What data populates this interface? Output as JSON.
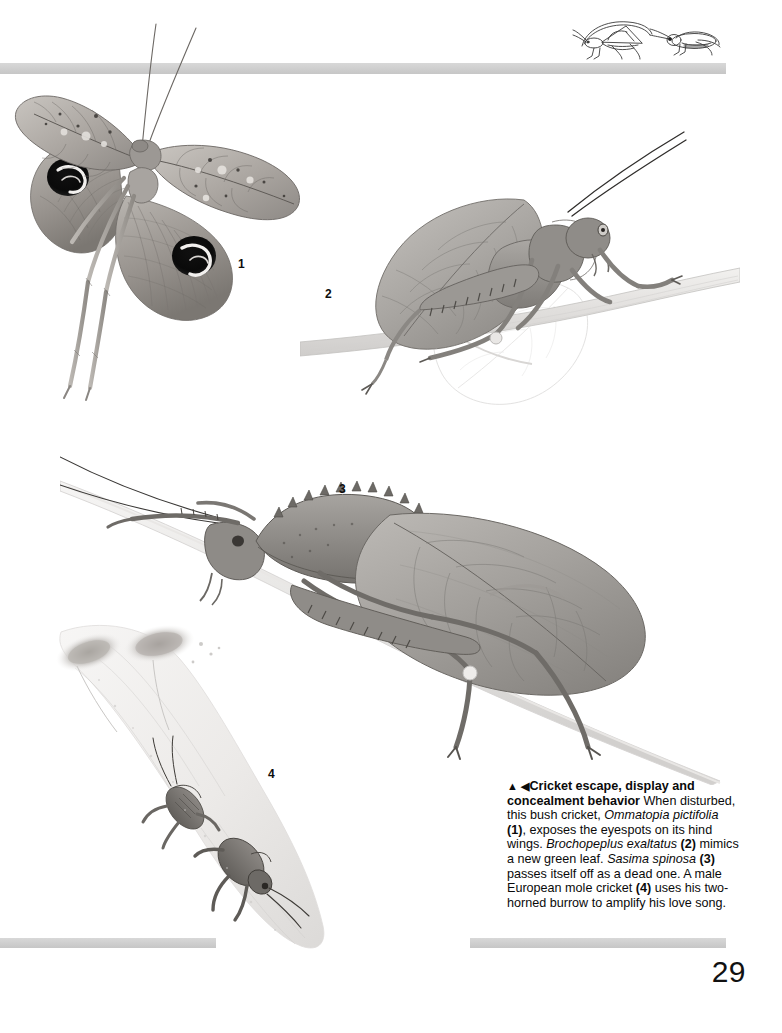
{
  "page": {
    "number": "29",
    "background_color": "#ffffff",
    "rule_color": "#cfcfcf",
    "text_color": "#0a0a0a"
  },
  "header": {
    "icons": [
      {
        "name": "bush-cricket-line-icon",
        "label": "bush cricket line drawing"
      },
      {
        "name": "grasshopper-line-icon",
        "label": "grasshopper line drawing"
      }
    ]
  },
  "figures": [
    {
      "number": "1",
      "name": "ommatopia-pictifolia-eyespot-display",
      "species": "Ommatopia pictifolia",
      "description": "Bush cricket with leaf-like forewings spread, exposing two dark eyespots on the hind wings"
    },
    {
      "number": "2",
      "name": "brochopeplus-exaltatus-green-leaf-mimic",
      "species": "Brochopeplus exaltatus",
      "description": "Katydid mimicking a new green leaf, perched on a twig with a pale leaf behind"
    },
    {
      "number": "3",
      "name": "sasima-spinosa-dead-leaf-mimic",
      "species": "Sasima spinosa",
      "description": "Spiny-pronotum katydid passing itself off as a dead leaf on a diagonal twig"
    },
    {
      "number": "4",
      "name": "european-mole-cricket-burrow",
      "species": "European mole cricket",
      "description": "Male mole cricket in its two-horned amplifying burrow, shown in cutaway"
    }
  ],
  "caption": {
    "marker_up": "▲",
    "marker_left": "◀",
    "title": "Cricket escape, display and concealment behavior",
    "body_1": " When disturbed, this bush cricket, ",
    "species_1": "Ommatopia pictifolia",
    "ref_1": " (1)",
    "body_2": ", exposes the eyespots on its hind wings. ",
    "species_2": "Brochopeplus exaltatus",
    "ref_2": " (2)",
    "body_3": " mimics a new green leaf. ",
    "species_3": "Sasima spinosa",
    "ref_3": " (3)",
    "body_4": " passes itself off as a dead one. A male European mole cricket ",
    "ref_4": "(4)",
    "body_5": " uses his two-horned burrow to amplify his love song."
  }
}
